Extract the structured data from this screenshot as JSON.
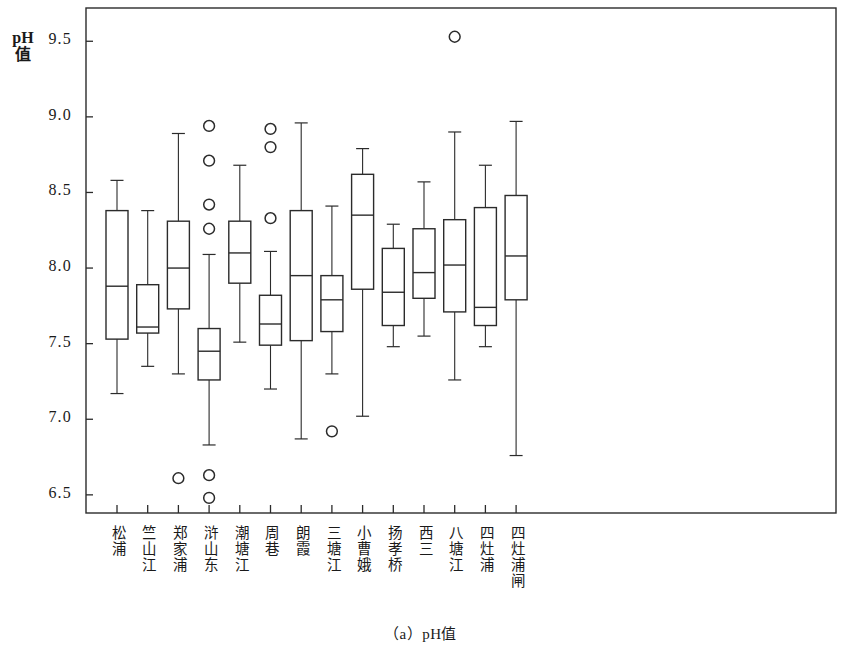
{
  "caption": "（a）pH值",
  "axis": {
    "y_label": "pH值",
    "y_ticks": [
      "9.5",
      "9.0",
      "8.5",
      "8.0",
      "7.5",
      "7.0",
      "6.5"
    ]
  },
  "chart_data": {
    "type": "box",
    "title": "（a）pH值",
    "xlabel": "",
    "ylabel": "pH值",
    "ylim": [
      6.38,
      9.72
    ],
    "yticks": [
      6.5,
      7.0,
      7.5,
      8.0,
      8.5,
      9.0,
      9.5
    ],
    "grid": false,
    "legend": null,
    "categories": [
      "松浦",
      "竺山江",
      "郑家浦",
      "浒山东",
      "潮塘江",
      "周巷",
      "朗霞",
      "三塘江",
      "小曹娥",
      "扬孝桥",
      "西三",
      "八塘江",
      "四灶浦",
      "四灶浦闸"
    ],
    "boxes": [
      {
        "category": "松浦",
        "whisker_low": 7.17,
        "q1": 7.53,
        "median": 7.88,
        "q3": 8.38,
        "whisker_high": 8.58,
        "outliers": []
      },
      {
        "category": "竺山江",
        "whisker_low": 7.35,
        "q1": 7.57,
        "median": 7.61,
        "q3": 7.89,
        "whisker_high": 8.38,
        "outliers": []
      },
      {
        "category": "郑家浦",
        "whisker_low": 7.3,
        "q1": 7.73,
        "median": 8.0,
        "q3": 8.31,
        "whisker_high": 8.89,
        "outliers": [
          6.61
        ]
      },
      {
        "category": "浒山东",
        "whisker_low": 6.83,
        "q1": 7.26,
        "median": 7.45,
        "q3": 7.6,
        "whisker_high": 8.09,
        "outliers": [
          8.94,
          8.71,
          8.42,
          8.26,
          6.63,
          6.48
        ]
      },
      {
        "category": "潮塘江",
        "whisker_low": 7.51,
        "q1": 7.9,
        "median": 8.1,
        "q3": 8.31,
        "whisker_high": 8.68,
        "outliers": []
      },
      {
        "category": "周巷",
        "whisker_low": 7.2,
        "q1": 7.49,
        "median": 7.63,
        "q3": 7.82,
        "whisker_high": 8.11,
        "outliers": [
          8.92,
          8.8,
          8.33
        ]
      },
      {
        "category": "朗霞",
        "whisker_low": 6.87,
        "q1": 7.52,
        "median": 7.95,
        "q3": 8.38,
        "whisker_high": 8.96,
        "outliers": []
      },
      {
        "category": "三塘江",
        "whisker_low": 7.3,
        "q1": 7.58,
        "median": 7.79,
        "q3": 7.95,
        "whisker_high": 8.41,
        "outliers": [
          6.92
        ]
      },
      {
        "category": "小曹娥",
        "whisker_low": 7.02,
        "q1": 7.86,
        "median": 8.35,
        "q3": 8.62,
        "whisker_high": 8.79,
        "outliers": []
      },
      {
        "category": "扬孝桥",
        "whisker_low": 7.48,
        "q1": 7.62,
        "median": 7.84,
        "q3": 8.13,
        "whisker_high": 8.29,
        "outliers": []
      },
      {
        "category": "西三",
        "whisker_low": 7.55,
        "q1": 7.8,
        "median": 7.97,
        "q3": 8.26,
        "whisker_high": 8.57,
        "outliers": []
      },
      {
        "category": "八塘江",
        "whisker_low": 7.26,
        "q1": 7.71,
        "median": 8.02,
        "q3": 8.32,
        "whisker_high": 8.9,
        "outliers": [
          9.53
        ]
      },
      {
        "category": "四灶浦",
        "whisker_low": 7.48,
        "q1": 7.62,
        "median": 7.74,
        "q3": 8.4,
        "whisker_high": 8.68,
        "outliers": []
      },
      {
        "category": "四灶浦闸",
        "whisker_low": 6.76,
        "q1": 7.79,
        "median": 8.08,
        "q3": 8.48,
        "whisker_high": 8.97,
        "outliers": []
      }
    ]
  }
}
